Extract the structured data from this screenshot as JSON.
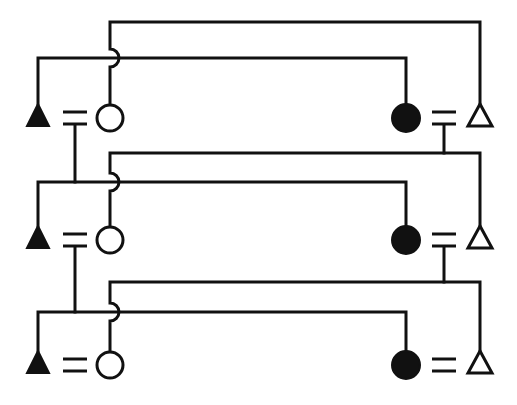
{
  "diagram": {
    "title": "",
    "type": "pedigree-like symbol diagram",
    "colors": {
      "line": "#111111",
      "background": "#ffffff"
    },
    "rows": [
      {
        "top_y": 22,
        "mid_y": 58,
        "sym_y": 118,
        "symbols": [
          {
            "kind": "filled-triangle",
            "x": 38
          },
          {
            "kind": "equals",
            "x": 75
          },
          {
            "kind": "open-circle",
            "x": 110
          },
          {
            "kind": "filled-circle",
            "x": 406
          },
          {
            "kind": "equals",
            "x": 444
          },
          {
            "kind": "open-triangle",
            "x": 480
          }
        ]
      },
      {
        "top_y": 153,
        "mid_y": 182,
        "sym_y": 240,
        "symbols": [
          {
            "kind": "filled-triangle",
            "x": 38
          },
          {
            "kind": "equals",
            "x": 75
          },
          {
            "kind": "open-circle",
            "x": 110
          },
          {
            "kind": "filled-circle",
            "x": 406
          },
          {
            "kind": "equals",
            "x": 444
          },
          {
            "kind": "open-triangle",
            "x": 480
          }
        ]
      },
      {
        "top_y": 282,
        "mid_y": 312,
        "sym_y": 365,
        "symbols": [
          {
            "kind": "filled-triangle",
            "x": 38
          },
          {
            "kind": "equals",
            "x": 75
          },
          {
            "kind": "open-circle",
            "x": 110
          },
          {
            "kind": "filled-circle",
            "x": 406
          },
          {
            "kind": "equals",
            "x": 444
          },
          {
            "kind": "open-triangle",
            "x": 480
          }
        ]
      }
    ]
  }
}
